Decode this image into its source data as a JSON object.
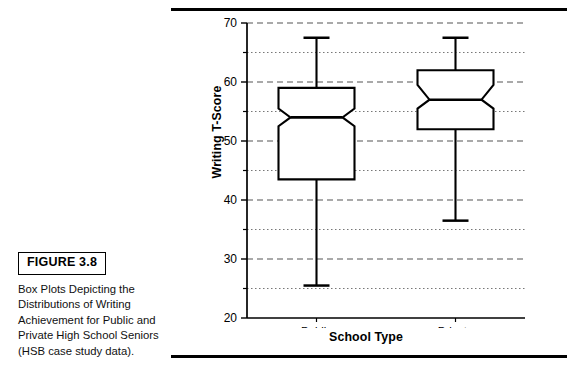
{
  "figure": {
    "badge_label": "FIGURE 3.8",
    "caption": "Box Plots Depicting the Distributions of Writing Achievement for Public and Private High School Seniors (HSB case study data)."
  },
  "chart_data": {
    "type": "box",
    "title": "",
    "xlabel": "School Type",
    "ylabel": "Writing T-Score",
    "categories": [
      "Public",
      "Private"
    ],
    "ylim": [
      20,
      70
    ],
    "ymajor_ticks": [
      20,
      30,
      40,
      50,
      60,
      70
    ],
    "yminor_ticks": [
      25,
      35,
      45,
      55,
      65
    ],
    "ytick_labels": [
      "20",
      "30",
      "40",
      "50",
      "60",
      "70"
    ],
    "grid": "major dashed, minor dotted, horizontal only",
    "legend": "none",
    "notched": true,
    "boxes": [
      {
        "name": "Public",
        "whisker_low": 25.5,
        "q1": 43.5,
        "median": 54.0,
        "q3": 59.0,
        "whisker_high": 67.5,
        "notch_low": 52.5,
        "notch_high": 55.5
      },
      {
        "name": "Private",
        "whisker_low": 36.5,
        "q1": 52.0,
        "median": 57.0,
        "q3": 62.0,
        "whisker_high": 67.5,
        "notch_low": 55.5,
        "notch_high": 59.5
      }
    ]
  },
  "colors": {
    "ink": "#000000",
    "grid_major": "#555555",
    "grid_minor": "#777777",
    "background": "#ffffff"
  }
}
